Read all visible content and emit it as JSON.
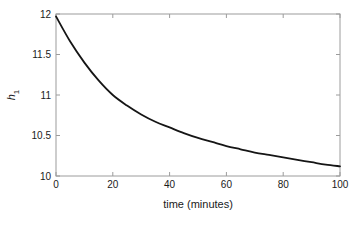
{
  "colors": {
    "background": "#ffffff",
    "axis_box": "#9c9c9c",
    "tick_text": "#1a1a1a",
    "curve": "#151515"
  },
  "chart_data": {
    "type": "line",
    "title": "",
    "xlabel": "time (minutes)",
    "ylabel": "h_1",
    "ylabel_base": "h",
    "ylabel_subscript": "1",
    "xlim": [
      0,
      100
    ],
    "ylim": [
      10,
      12
    ],
    "xticks": [
      0,
      20,
      40,
      60,
      80,
      100
    ],
    "xtick_labels": [
      "0",
      "20",
      "40",
      "60",
      "80",
      "100"
    ],
    "yticks": [
      10,
      10.5,
      11,
      11.5,
      12
    ],
    "ytick_labels": [
      "10",
      "10.5",
      "11",
      "11.5",
      "12"
    ],
    "grid": false,
    "legend": "none",
    "box": true,
    "series": [
      {
        "name": "h1",
        "color": "#151515",
        "x": [
          0,
          5,
          10,
          15,
          20,
          25,
          30,
          35,
          40,
          45,
          50,
          55,
          60,
          65,
          70,
          75,
          80,
          85,
          90,
          95,
          100
        ],
        "y": [
          11.97,
          11.66,
          11.4,
          11.18,
          11.0,
          10.87,
          10.76,
          10.67,
          10.6,
          10.53,
          10.47,
          10.42,
          10.37,
          10.33,
          10.29,
          10.26,
          10.23,
          10.2,
          10.17,
          10.14,
          10.12
        ]
      }
    ]
  }
}
